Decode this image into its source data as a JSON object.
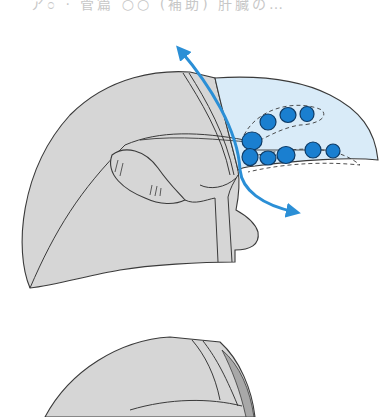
{
  "figure": {
    "top_caption_partial": "ア೦  ·  菅篇 ○○  (補助)  肝臓の…",
    "colors": {
      "liver_fill": "#d6d6d6",
      "outline": "#3a3a3a",
      "resected_segment": "#d9ebf8",
      "stone_fill": "#1a7fd0",
      "arrow": "#2b8fd6",
      "shadow_edge": "#a8a8a8"
    },
    "stones_count": 10,
    "views": [
      "upper-liver-view",
      "lower-liver-view-partial"
    ]
  }
}
